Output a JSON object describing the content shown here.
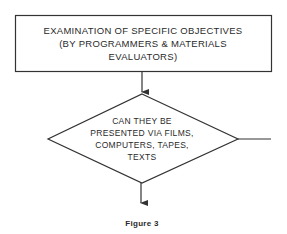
{
  "diagram": {
    "process_box": {
      "lines": [
        "EXAMINATION OF SPECIFIC OBJECTIVES",
        "(BY PROGRAMMERS & MATERIALS",
        "EVALUATORS)"
      ]
    },
    "decision_diamond": {
      "lines": [
        "CAN THEY BE",
        "PRESENTED VIA FILMS,",
        "COMPUTERS, TAPES,",
        "TEXTS"
      ]
    },
    "caption": "Figure 3",
    "colors": {
      "stroke": "#333333",
      "text": "#2a2a2a",
      "background": "#ffffff"
    }
  }
}
